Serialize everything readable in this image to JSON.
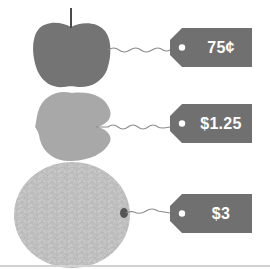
{
  "figure": {
    "items": [
      {
        "fruit": "apple",
        "icon": "apple-icon",
        "price": "75¢",
        "color": "#737373"
      },
      {
        "fruit": "peach",
        "icon": "peach-icon",
        "price": "$1.25",
        "color": "#a6a6a6"
      },
      {
        "fruit": "cantaloupe",
        "icon": "cantaloupe-icon",
        "price": "$3",
        "color": "#c4c4c4"
      }
    ],
    "tag_color": "#707070",
    "tag_text_color": "#ffffff",
    "string_color": "#8a8a8a",
    "background": "#ffffff"
  }
}
